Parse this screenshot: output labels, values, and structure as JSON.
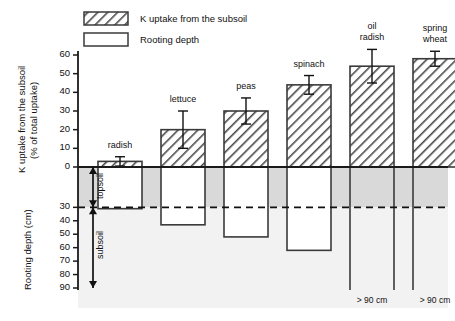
{
  "chart_data": {
    "type": "bar",
    "title": "",
    "subtitle": "",
    "categories": [
      "radish",
      "lettuce",
      "peas",
      "spinach",
      "oil radish",
      "spring wheat"
    ],
    "series": [
      {
        "name": "K uptake from the subsoil",
        "unit": "% of total uptake",
        "values": [
          3,
          20,
          30,
          44,
          54,
          58
        ],
        "errors": [
          2.5,
          10,
          7,
          5,
          9,
          4
        ],
        "pattern": "diagonal-hatch",
        "direction": "up"
      },
      {
        "name": "Rooting depth",
        "unit": "cm",
        "values": [
          31,
          43,
          52,
          62,
          95,
          95
        ],
        "value_labels": [
          "",
          "",
          "",
          "",
          "> 90 cm",
          "> 90 cm"
        ],
        "pattern": "white-fill",
        "direction": "down"
      }
    ],
    "axes": {
      "top": {
        "label_line1": "K uptake from the subsoil",
        "label_line2": "(% of total uptake)",
        "ticks": [
          0,
          10,
          20,
          30,
          40,
          50,
          60
        ],
        "range": [
          0,
          60
        ]
      },
      "bottom": {
        "label": "Rooting depth (cm)",
        "ticks": [
          30,
          40,
          50,
          60,
          70,
          80,
          90
        ],
        "range": [
          0,
          90
        ]
      }
    },
    "annotations": {
      "topsoil_label": "topsoil",
      "subsoil_label": "subsoil",
      "topsoil_range_cm": [
        0,
        30
      ],
      "subsoil_range_cm": [
        30,
        90
      ],
      "dashed_line_cm": 30,
      "beyond_scale_note": "> 90 cm"
    },
    "grid": false,
    "legend_position": "top-center"
  },
  "legend": {
    "items": [
      {
        "label": "K uptake from the subsoil",
        "swatch": "hatched"
      },
      {
        "label": "Rooting depth",
        "swatch": "empty"
      }
    ]
  },
  "colors": {
    "axis": "#1a1a1a",
    "bar_outline": "#3a3a3a",
    "hatch": "#4a4a4a",
    "topsoil_fill": "#d9d9d9",
    "subsoil_fill": "#f2f2f2",
    "background": "#ffffff"
  }
}
